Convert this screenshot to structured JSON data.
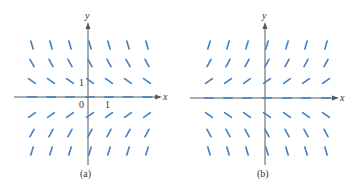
{
  "figure": {
    "panels": [
      {
        "id": "a",
        "caption": "(a)",
        "x_axis_label": "x",
        "y_axis_label": "y",
        "origin_label": "0",
        "x_tick_label": "1",
        "y_tick_label": "1",
        "slope_rule": "negative above x-axis, positive below; steeper farther from x-axis",
        "origin_px": [
          88,
          97
        ]
      },
      {
        "id": "b",
        "caption": "(b)",
        "x_axis_label": "x",
        "y_axis_label": "y",
        "slope_rule": "positive above x-axis, negative below; steeper farther from x-axis",
        "origin_px": [
          265,
          98
        ]
      }
    ],
    "colors": {
      "segment": "#3f7fc4",
      "axis": "#555a60",
      "text": "#333333"
    }
  }
}
